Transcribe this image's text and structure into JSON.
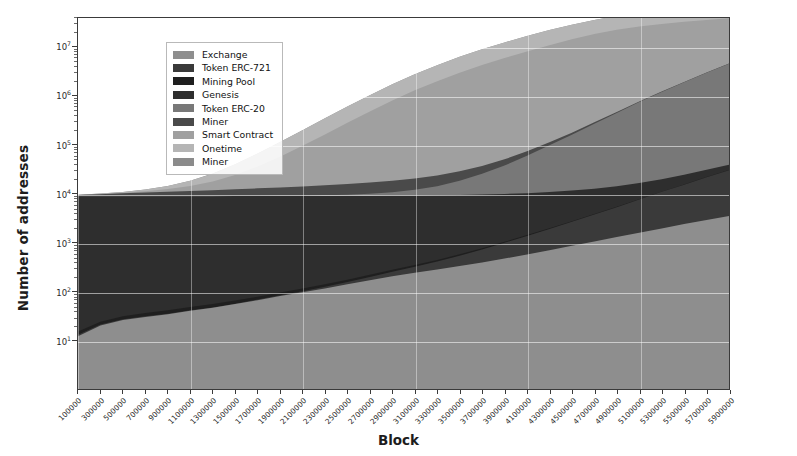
{
  "chart_data": {
    "type": "area",
    "stacked": true,
    "title": "",
    "xlabel": "Block",
    "ylabel": "Number of addresses",
    "yscale": "log",
    "ylim": [
      1,
      40000000
    ],
    "xlim": [
      100000,
      5900000
    ],
    "grid": true,
    "legend_position": "upper left",
    "y_ticks": [
      {
        "value": 10,
        "label": "10",
        "exponent": "1"
      },
      {
        "value": 100,
        "label": "10",
        "exponent": "2"
      },
      {
        "value": 1000,
        "label": "10",
        "exponent": "3"
      },
      {
        "value": 10000,
        "label": "10",
        "exponent": "4"
      },
      {
        "value": 100000,
        "label": "10",
        "exponent": "5"
      },
      {
        "value": 1000000,
        "label": "10",
        "exponent": "6"
      },
      {
        "value": 10000000,
        "label": "10",
        "exponent": "7"
      }
    ],
    "x_tick_labels": [
      "100000",
      "300000",
      "500000",
      "700000",
      "900000",
      "1100000",
      "1300000",
      "1500000",
      "1700000",
      "1900000",
      "2100000",
      "2300000",
      "2500000",
      "2700000",
      "2900000",
      "3100000",
      "3300000",
      "3500000",
      "3700000",
      "3900000",
      "4100000",
      "4300000",
      "4500000",
      "4700000",
      "4900000",
      "5100000",
      "5300000",
      "5500000",
      "5700000",
      "5900000"
    ],
    "x": [
      100000,
      300000,
      500000,
      700000,
      900000,
      1100000,
      1300000,
      1500000,
      1700000,
      1900000,
      2100000,
      2300000,
      2500000,
      2700000,
      2900000,
      3100000,
      3300000,
      3500000,
      3700000,
      3900000,
      4100000,
      4300000,
      4500000,
      4700000,
      4900000,
      5100000,
      5300000,
      5500000,
      5700000,
      5900000
    ],
    "series": [
      {
        "name": "Exchange",
        "color": "#8e8e8e",
        "values": [
          12,
          20,
          26,
          30,
          34,
          40,
          46,
          55,
          66,
          80,
          96,
          115,
          140,
          170,
          205,
          240,
          280,
          330,
          390,
          470,
          570,
          700,
          860,
          1050,
          1300,
          1600,
          1950,
          2400,
          2900,
          3500
        ]
      },
      {
        "name": "Token ERC-721",
        "color": "#3a3a3a",
        "values": [
          1,
          1,
          1,
          1,
          1,
          1,
          1,
          1,
          2,
          3,
          5,
          9,
          16,
          28,
          48,
          80,
          130,
          210,
          330,
          520,
          800,
          1200,
          1800,
          2700,
          4000,
          6000,
          9000,
          13000,
          19000,
          27000
        ]
      },
      {
        "name": "Mining Pool",
        "color": "#1f1f1f",
        "values": [
          2,
          3,
          4,
          5,
          6,
          7,
          8,
          9,
          10,
          12,
          14,
          16,
          18,
          21,
          24,
          28,
          32,
          37,
          42,
          48,
          55,
          63,
          72,
          82,
          94,
          107,
          122,
          139,
          158,
          180
        ]
      },
      {
        "name": "Genesis",
        "color": "#2e2e2e",
        "values": [
          8893,
          8893,
          8893,
          8893,
          8893,
          8893,
          8893,
          8893,
          8893,
          8893,
          8893,
          8893,
          8893,
          8893,
          8893,
          8893,
          8893,
          8893,
          8893,
          8893,
          8893,
          8893,
          8893,
          8893,
          8893,
          8893,
          8893,
          8893,
          8893,
          8893
        ]
      },
      {
        "name": "Token ERC-20",
        "color": "#787878",
        "values": [
          1,
          1,
          2,
          3,
          5,
          9,
          16,
          28,
          50,
          90,
          160,
          280,
          500,
          900,
          1600,
          2800,
          5000,
          9000,
          16000,
          28000,
          50000,
          88000,
          150000,
          260000,
          440000,
          740000,
          1200000,
          1900000,
          3000000,
          4600000
        ]
      },
      {
        "name": "Miner",
        "color": "#4a4a4a",
        "values": [
          520,
          900,
          1300,
          1700,
          2100,
          2500,
          2900,
          3400,
          3900,
          4400,
          5000,
          5600,
          6300,
          7000,
          7800,
          8600,
          9500,
          10500,
          11600,
          12800,
          14100,
          15500,
          17000,
          18600,
          20300,
          22100,
          24000,
          26000,
          28100,
          30300
        ]
      },
      {
        "name": "Smart Contract",
        "color": "#a0a0a0",
        "values": [
          30,
          120,
          300,
          700,
          1500,
          3000,
          6000,
          12000,
          23000,
          44000,
          82000,
          150000,
          270000,
          470000,
          800000,
          1300000,
          2000000,
          3000000,
          4300000,
          6000000,
          8200000,
          11000000,
          14500000,
          18500000,
          22500000,
          26000000,
          29000000,
          31500000,
          33500000,
          35000000
        ]
      },
      {
        "name": "Onetime",
        "color": "#b5b5b5",
        "values": [
          40,
          150,
          400,
          900,
          1900,
          4000,
          8000,
          16000,
          31000,
          58000,
          105000,
          190000,
          330000,
          560000,
          930000,
          1500000,
          2300000,
          3400000,
          4800000,
          6600000,
          8800000,
          11500000,
          14500000,
          17800000,
          21000000,
          24000000,
          26500000,
          28500000,
          30000000,
          31000000
        ]
      },
      {
        "name": "Miner",
        "color": "#8b8b8b",
        "values": [
          9,
          14,
          18,
          22,
          26,
          30,
          35,
          41,
          48,
          56,
          65,
          76,
          88,
          102,
          118,
          137,
          158,
          183,
          211,
          244,
          281,
          325,
          375,
          432,
          498,
          574,
          662,
          763,
          879,
          1013
        ]
      }
    ]
  },
  "legend": {
    "items": [
      {
        "label": "Exchange",
        "color": "#8e8e8e"
      },
      {
        "label": "Token ERC-721",
        "color": "#3a3a3a"
      },
      {
        "label": "Mining Pool",
        "color": "#1f1f1f"
      },
      {
        "label": "Genesis",
        "color": "#2e2e2e"
      },
      {
        "label": "Token ERC-20",
        "color": "#787878"
      },
      {
        "label": "Miner",
        "color": "#4a4a4a"
      },
      {
        "label": "Smart Contract",
        "color": "#a0a0a0"
      },
      {
        "label": "Onetime",
        "color": "#b5b5b5"
      },
      {
        "label": "Miner",
        "color": "#8b8b8b"
      }
    ]
  }
}
